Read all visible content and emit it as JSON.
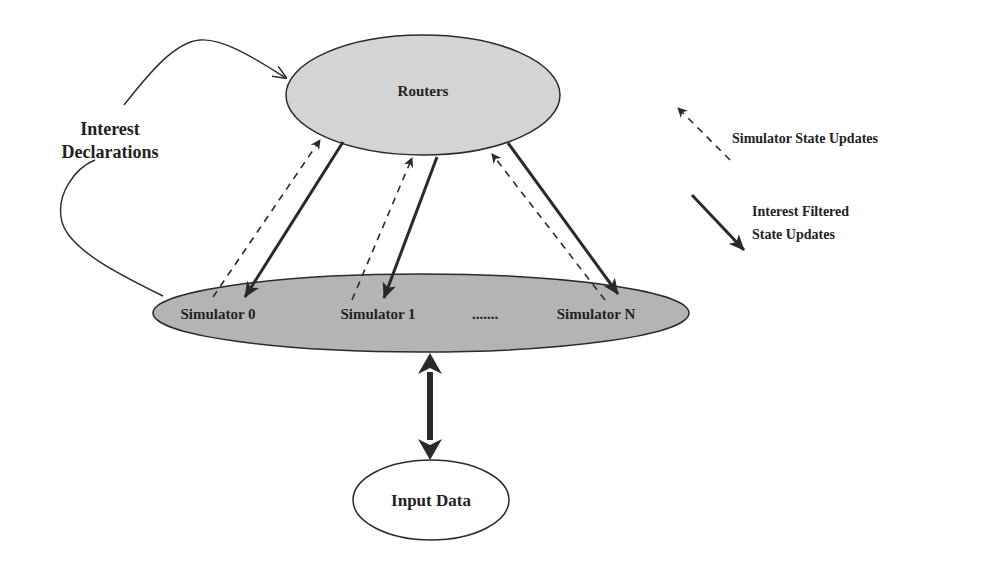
{
  "diagram": {
    "nodes": {
      "routers": {
        "label": "Routers"
      },
      "simulators": {
        "items": [
          {
            "label": "Simulator 0"
          },
          {
            "label": "Simulator 1"
          },
          {
            "label": "Simulator N"
          }
        ],
        "ellipsis": "......."
      },
      "input_data": {
        "label": "Input Data"
      }
    },
    "edges": {
      "interest_declarations": {
        "label_line1": "Interest",
        "label_line2": "Declarations"
      }
    },
    "legend": {
      "dashed_arrow": {
        "label": "Simulator State Updates"
      },
      "solid_arrow": {
        "label_line1": "Interest Filtered",
        "label_line2": "State Updates"
      }
    },
    "colors": {
      "node_fill_light": "#d4d4d4",
      "node_fill_dark": "#b4b4b4",
      "stroke": "#2a2a2a",
      "input_fill": "#ffffff"
    }
  }
}
